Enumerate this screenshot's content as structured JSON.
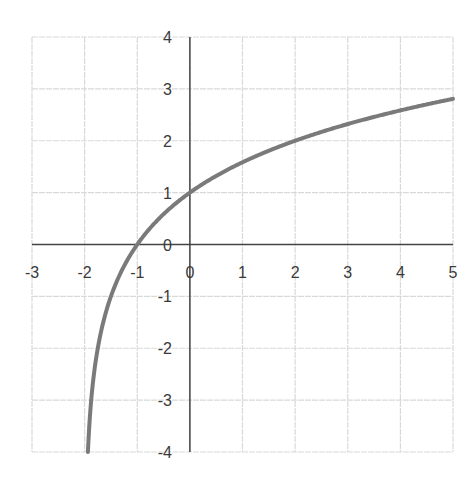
{
  "chart_data": {
    "type": "line",
    "title": "",
    "xlabel": "",
    "ylabel": "",
    "function": "y = log2(x + 2)",
    "xlim": [
      -3,
      5
    ],
    "ylim": [
      -4,
      4
    ],
    "grid": true,
    "legend": null,
    "x_ticks": [
      "-3",
      "-2",
      "-1",
      "0",
      "1",
      "2",
      "3",
      "4",
      "5"
    ],
    "y_ticks": [
      "4",
      "3",
      "2",
      "1",
      "0",
      "-1",
      "-2",
      "-3",
      "-4"
    ],
    "series": [
      {
        "name": "curve",
        "color": "#7a7a7a",
        "x": [
          -1.9375,
          -1.875,
          -1.75,
          -1.5,
          -1.25,
          -1,
          -0.5,
          0,
          0.5,
          1,
          1.5,
          2,
          2.5,
          3,
          3.5,
          4,
          4.5,
          5
        ],
        "y": [
          -4,
          -3,
          -2,
          -1,
          -0.415,
          0,
          0.585,
          1,
          1.322,
          1.585,
          1.807,
          2,
          2.17,
          2.322,
          2.459,
          2.585,
          2.7,
          2.807
        ]
      }
    ],
    "colors": {
      "curve": "#7a7a7a",
      "axes": "#444444",
      "grid": "#d9d9d9",
      "text": "#3a3a3a"
    }
  }
}
